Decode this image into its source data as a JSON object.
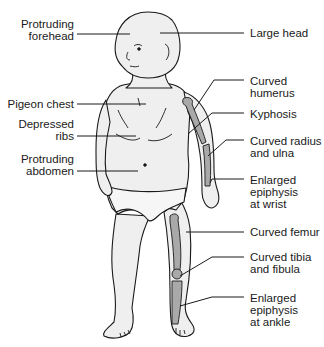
{
  "colors": {
    "skin": "#efefef",
    "bone": "#a9a9a9",
    "outline": "#1a1a1a",
    "leader": "#1a1a1a",
    "text": "#1a1a1a"
  },
  "labels_left": [
    {
      "id": "protruding-forehead",
      "text": "Protruding\nforehead"
    },
    {
      "id": "pigeon-chest",
      "text": "Pigeon chest"
    },
    {
      "id": "depressed-ribs",
      "text": "Depressed\nribs"
    },
    {
      "id": "protruding-abdomen",
      "text": "Protruding\nabdomen"
    }
  ],
  "labels_right": [
    {
      "id": "large-head",
      "text": "Large head"
    },
    {
      "id": "curved-humerus",
      "text": "Curved\nhumerus"
    },
    {
      "id": "kyphosis",
      "text": "Kyphosis"
    },
    {
      "id": "curved-radius-ulna",
      "text": "Curved radius\nand ulna"
    },
    {
      "id": "enlarged-epiphysis-wrist",
      "text": "Enlarged\nepiphysis\nat wrist"
    },
    {
      "id": "curved-femur",
      "text": "Curved femur"
    },
    {
      "id": "curved-tibia-fibula",
      "text": "Curved tibia\nand fibula"
    },
    {
      "id": "enlarged-epiphysis-ankle",
      "text": "Enlarged\nepiphysis\nat ankle"
    }
  ]
}
